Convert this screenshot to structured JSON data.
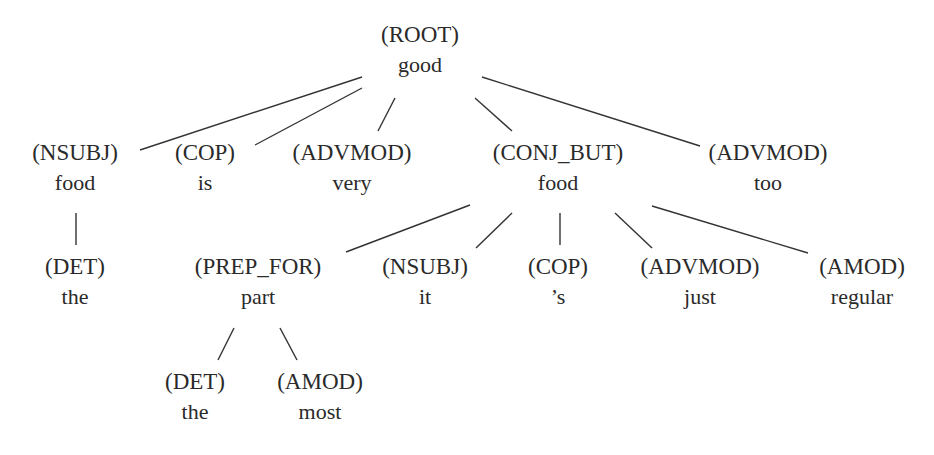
{
  "diagram": {
    "type": "dependency-tree",
    "nodes": [
      {
        "id": "n0",
        "relation": "(ROOT)",
        "word": "good",
        "x": 420,
        "y": 20
      },
      {
        "id": "n1",
        "relation": "(NSUBJ)",
        "word": "food",
        "x": 75,
        "y": 138
      },
      {
        "id": "n2",
        "relation": "(COP)",
        "word": "is",
        "x": 205,
        "y": 138
      },
      {
        "id": "n3",
        "relation": "(ADVMOD)",
        "word": "very",
        "x": 352,
        "y": 138
      },
      {
        "id": "n4",
        "relation": "(CONJ_BUT)",
        "word": "food",
        "x": 558,
        "y": 138
      },
      {
        "id": "n5",
        "relation": "(ADVMOD)",
        "word": "too",
        "x": 768,
        "y": 138
      },
      {
        "id": "n6",
        "relation": "(DET)",
        "word": "the",
        "x": 75,
        "y": 252
      },
      {
        "id": "n7",
        "relation": "(PREP_FOR)",
        "word": "part",
        "x": 258,
        "y": 252
      },
      {
        "id": "n8",
        "relation": "(NSUBJ)",
        "word": "it",
        "x": 425,
        "y": 252
      },
      {
        "id": "n9",
        "relation": "(COP)",
        "word": "’s",
        "x": 558,
        "y": 252
      },
      {
        "id": "n10",
        "relation": "(ADVMOD)",
        "word": "just",
        "x": 700,
        "y": 252
      },
      {
        "id": "n11",
        "relation": "(AMOD)",
        "word": "regular",
        "x": 862,
        "y": 252
      },
      {
        "id": "n12",
        "relation": "(DET)",
        "word": "the",
        "x": 195,
        "y": 367
      },
      {
        "id": "n13",
        "relation": "(AMOD)",
        "word": "most",
        "x": 320,
        "y": 367
      }
    ],
    "edges": [
      {
        "from": "n0",
        "to": "n1",
        "x1": 362,
        "y1": 77,
        "x2": 140,
        "y2": 150
      },
      {
        "from": "n0",
        "to": "n2",
        "x1": 362,
        "y1": 88,
        "x2": 255,
        "y2": 145
      },
      {
        "from": "n0",
        "to": "n3",
        "x1": 395,
        "y1": 98,
        "x2": 378,
        "y2": 131
      },
      {
        "from": "n0",
        "to": "n4",
        "x1": 475,
        "y1": 98,
        "x2": 512,
        "y2": 131
      },
      {
        "from": "n0",
        "to": "n5",
        "x1": 482,
        "y1": 77,
        "x2": 700,
        "y2": 146
      },
      {
        "from": "n1",
        "to": "n6",
        "x1": 76,
        "y1": 213,
        "x2": 76,
        "y2": 245
      },
      {
        "from": "n4",
        "to": "n7",
        "x1": 470,
        "y1": 205,
        "x2": 346,
        "y2": 252
      },
      {
        "from": "n4",
        "to": "n8",
        "x1": 512,
        "y1": 213,
        "x2": 476,
        "y2": 248
      },
      {
        "from": "n4",
        "to": "n9",
        "x1": 560,
        "y1": 213,
        "x2": 560,
        "y2": 245
      },
      {
        "from": "n4",
        "to": "n10",
        "x1": 615,
        "y1": 213,
        "x2": 652,
        "y2": 248
      },
      {
        "from": "n4",
        "to": "n11",
        "x1": 652,
        "y1": 206,
        "x2": 808,
        "y2": 253
      },
      {
        "from": "n7",
        "to": "n12",
        "x1": 234,
        "y1": 328,
        "x2": 218,
        "y2": 360
      },
      {
        "from": "n7",
        "to": "n13",
        "x1": 280,
        "y1": 328,
        "x2": 297,
        "y2": 360
      }
    ]
  }
}
